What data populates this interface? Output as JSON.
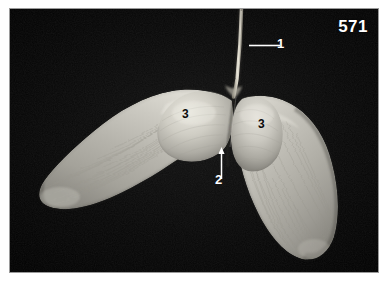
{
  "figure": {
    "number": "571",
    "background_color": "#050505",
    "plate_border_color": "#9a9a9a",
    "page_background": "#ffffff",
    "specimen_color": "#bcbcb6",
    "specimen_shadow_color": "#6d6d68",
    "stem_color": "#cfcabb",
    "leader_line_color": "#ffffff"
  },
  "annotations": [
    {
      "id": "1",
      "label": "1",
      "color": "#ffffff",
      "points_to": "stem-pedicel",
      "leader": "horizontal-line"
    },
    {
      "id": "2",
      "label": "2",
      "color": "#ffffff",
      "points_to": "seed-junction",
      "leader": "vertical-arrow-up"
    },
    {
      "id": "3a",
      "label": "3",
      "color": "#090909",
      "points_to": "left-wing-seed-body",
      "leader": "none"
    },
    {
      "id": "3b",
      "label": "3",
      "color": "#090909",
      "points_to": "right-wing-seed-body",
      "leader": "none"
    }
  ]
}
